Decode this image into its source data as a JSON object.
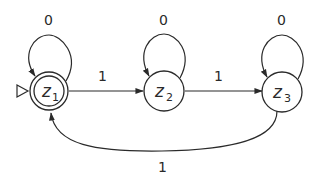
{
  "diagram": {
    "type": "finite-state-automaton",
    "states": [
      {
        "id": "z1",
        "name": "z",
        "sub": "1",
        "initial": true,
        "accepting": true
      },
      {
        "id": "z2",
        "name": "z",
        "sub": "2",
        "initial": false,
        "accepting": false
      },
      {
        "id": "z3",
        "name": "z",
        "sub": "3",
        "initial": false,
        "accepting": false
      }
    ],
    "transitions": [
      {
        "from": "z1",
        "to": "z1",
        "label": "0"
      },
      {
        "from": "z2",
        "to": "z2",
        "label": "0"
      },
      {
        "from": "z3",
        "to": "z3",
        "label": "0"
      },
      {
        "from": "z1",
        "to": "z2",
        "label": "1"
      },
      {
        "from": "z2",
        "to": "z3",
        "label": "1"
      },
      {
        "from": "z3",
        "to": "z1",
        "label": "1"
      }
    ],
    "colors": {
      "stroke": "#2a2a2a",
      "background": "#ffffff"
    }
  }
}
